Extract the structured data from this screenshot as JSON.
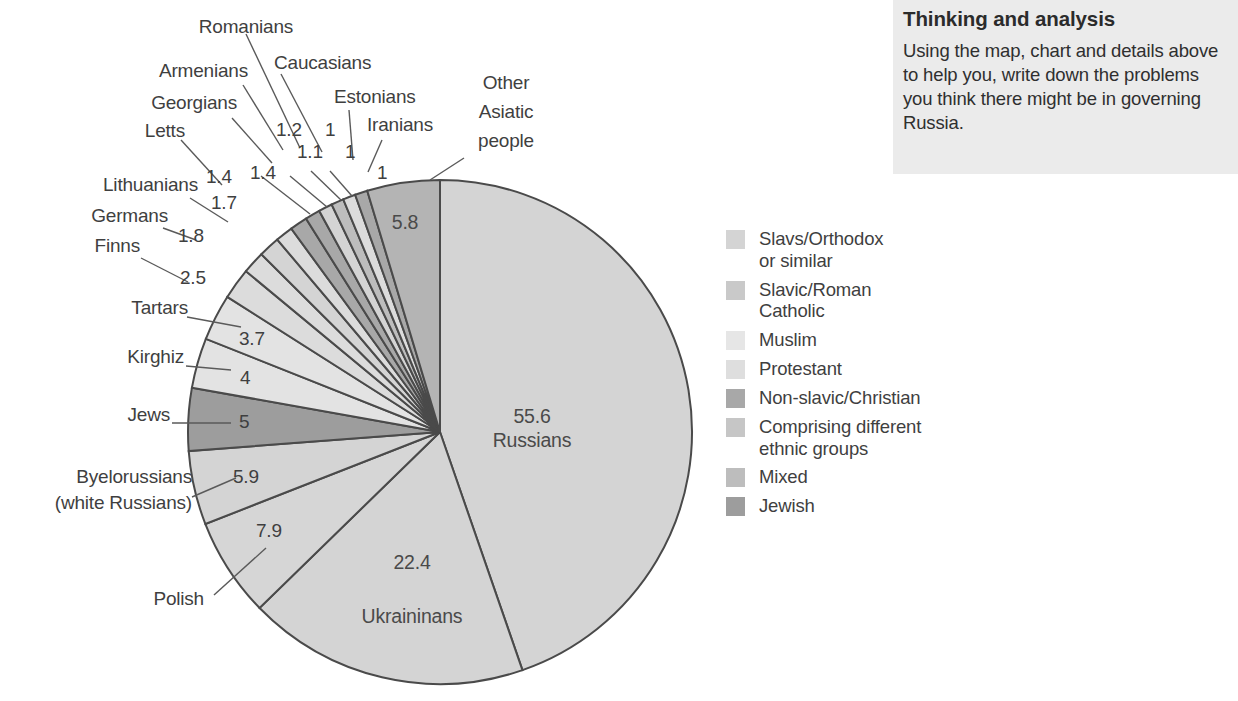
{
  "thinking": {
    "title": "Thinking and analysis",
    "body": "Using the map, chart and details above to help you, write down the problems you think there might be in governing Russia."
  },
  "chart_data": {
    "type": "pie",
    "title": "",
    "units": "percent",
    "legend_position": "right",
    "center": {
      "x": 440,
      "y": 432
    },
    "radius": 252,
    "start_angle_deg": 0,
    "direction": "clockwise",
    "categories": [
      "Russians",
      "Ukraininans",
      "Polish",
      "Byelorussians (white Russians)",
      "Jews",
      "Kirghiz",
      "Tartars",
      "Finns",
      "Germans",
      "Lithuanians",
      "Letts",
      "Georgians",
      "Armenians",
      "Romanians",
      "Caucasians",
      "Estonians",
      "Iranians",
      "Other Asiatic people"
    ],
    "values": [
      55.6,
      22.4,
      7.9,
      5.9,
      5,
      4,
      3.7,
      2.5,
      1.8,
      1.7,
      1.4,
      1.4,
      1.2,
      1.1,
      1,
      1,
      1,
      5.8
    ],
    "value_labels": [
      "55.6",
      "22.4",
      "7.9",
      "5.9",
      "5",
      "4",
      "3.7",
      "2.5",
      "1.8",
      "1.7",
      "1.4",
      "1.4",
      "1.2",
      "1.1",
      "1",
      "1",
      "1",
      "5.8"
    ],
    "slice_groups": [
      "Slavs/Orthodox or similar",
      "Slavs/Orthodox or similar",
      "Slavic/Roman Catholic",
      "Slavs/Orthodox or similar",
      "Jewish",
      "Muslim",
      "Muslim",
      "Protestant",
      "Protestant",
      "Slavs/Orthodox or similar",
      "Protestant",
      "Non-slavic/Christian",
      "Non-slavic/Christian",
      "Slavs/Orthodox or similar",
      "Mixed",
      "Protestant",
      "Non-slavic/Christian",
      "Comprising different ethnic groups"
    ],
    "slice_colors": [
      "#d4d4d4",
      "#d4d4d4",
      "#d6d6d6",
      "#d4d4d4",
      "#9d9d9d",
      "#e3e3e3",
      "#e3e3e3",
      "#dcdcdc",
      "#dcdcdc",
      "#d4d4d4",
      "#dcdcdc",
      "#a8a8a8",
      "#a8a8a8",
      "#d4d4d4",
      "#bdbdbd",
      "#dcdcdc",
      "#a8a8a8",
      "#b4b4b4"
    ]
  },
  "inside_labels": [
    {
      "value": "55.6",
      "name": "Russians"
    },
    {
      "value": "22.4",
      "name": "Ukraininans"
    },
    {
      "value": "5.8",
      "name": ""
    }
  ],
  "callouts": [
    {
      "name": "Romanians",
      "value": "1.2"
    },
    {
      "name": "Caucasians",
      "value": "1.1"
    },
    {
      "name": "Armenians",
      "value": "1.4"
    },
    {
      "name": "Estonians",
      "value": "1"
    },
    {
      "name": "Georgians",
      "value": "1.4"
    },
    {
      "name": "Iranians",
      "value": "1"
    },
    {
      "name": "Letts",
      "value": "1"
    },
    {
      "name": "Lithuanians",
      "value": "1.7"
    },
    {
      "name": "Germans",
      "value": "1.8"
    },
    {
      "name": "Finns",
      "value": "2.5"
    },
    {
      "name": "Tartars",
      "value": "3.7"
    },
    {
      "name": "Kirghiz",
      "value": "4"
    },
    {
      "name": "Jews",
      "value": "5"
    },
    {
      "name": "Byelorussians",
      "value": "5.9"
    },
    {
      "name": "(white Russians)",
      "value": ""
    },
    {
      "name": "Polish",
      "value": "7.9"
    },
    {
      "name": "Other",
      "value": ""
    },
    {
      "name": "Asiatic",
      "value": ""
    },
    {
      "name": "people",
      "value": ""
    }
  ],
  "legend": {
    "items": [
      {
        "label": "Slavs/Orthodox\nor similar",
        "line1": "Slavs/Orthodox",
        "line2": "or similar",
        "color": "#d4d4d4"
      },
      {
        "label": "Slavic/Roman\nCatholic",
        "line1": "Slavic/Roman",
        "line2": "Catholic",
        "color": "#c9c9c9"
      },
      {
        "label": "Muslim",
        "line1": "Muslim",
        "line2": "",
        "color": "#e6e6e6"
      },
      {
        "label": "Protestant",
        "line1": "Protestant",
        "line2": "",
        "color": "#dedede"
      },
      {
        "label": "Non-slavic/Christian",
        "line1": "Non-slavic/Christian",
        "line2": "",
        "color": "#a8a8a8"
      },
      {
        "label": "Comprising different\nethnic groups",
        "line1": "Comprising different",
        "line2": "ethnic groups",
        "color": "#c6c6c6"
      },
      {
        "label": "Mixed",
        "line1": "Mixed",
        "line2": "",
        "color": "#bdbdbd"
      },
      {
        "label": "Jewish",
        "line1": "Jewish",
        "line2": "",
        "color": "#9d9d9d"
      }
    ]
  }
}
